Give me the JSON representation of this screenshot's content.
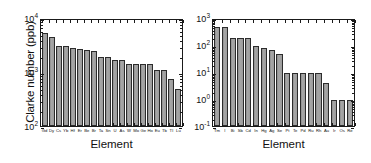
{
  "chart_data": [
    {
      "type": "bar",
      "panel": "left",
      "title": "",
      "xlabel": "Element",
      "ylabel": "Clarke number (ppb)",
      "yscale": "log",
      "ylim": [
        100,
        10000
      ],
      "ytick_labels": [
        "10",
        "10",
        "10"
      ],
      "ytick_exponents": [
        "2",
        "3",
        "4"
      ],
      "ytick_values": [
        100,
        1000,
        10000
      ],
      "grid": false,
      "legend": "none",
      "categories": [
        "Gd",
        "Dy",
        "Cs",
        "Yb",
        "Hf",
        "Er",
        "Be",
        "Br",
        "Ta",
        "Sn",
        "U",
        "As",
        "W",
        "Mo",
        "Ge",
        "Ho",
        "Eu",
        "Tb",
        "Tl",
        "Lu"
      ],
      "values": [
        5200,
        4500,
        3000,
        3000,
        2800,
        2700,
        2600,
        2400,
        1900,
        1900,
        1700,
        1700,
        1400,
        1400,
        1400,
        1400,
        1100,
        1100,
        750,
        480
      ]
    },
    {
      "type": "bar",
      "panel": "right",
      "title": "",
      "xlabel": "Element",
      "ylabel": "",
      "yscale": "log",
      "ylim": [
        0.1,
        1000
      ],
      "ytick_labels": [
        "10",
        "10",
        "10",
        "10",
        "10"
      ],
      "ytick_exponents": [
        "-1",
        "0",
        "1",
        "2",
        "3"
      ],
      "ytick_values": [
        0.1,
        1,
        10,
        100,
        1000
      ],
      "grid": false,
      "legend": "none",
      "categories": [
        "Tm",
        "I",
        "Bi",
        "Sb",
        "Cd",
        "In",
        "Hg",
        "Ag",
        "Se",
        "Pt",
        "Te",
        "Pd",
        "Ru",
        "Rh",
        "Au",
        "Ir",
        "Os",
        "Re"
      ],
      "values": [
        450,
        460,
        180,
        180,
        180,
        90,
        75,
        65,
        48,
        9,
        9,
        9,
        9,
        9,
        4,
        0.9,
        0.9,
        0.9
      ]
    }
  ],
  "left_panel": {
    "ylabel": "Clarke number (ppb)",
    "xlabel": "Element"
  },
  "right_panel": {
    "xlabel": "Element"
  }
}
